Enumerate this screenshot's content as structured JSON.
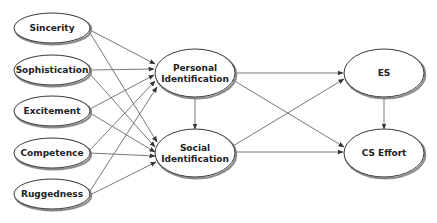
{
  "diagram": {
    "type": "path-model",
    "colors": {
      "background": "#ffffff",
      "node_stroke": "#3a3a3a",
      "node_shadow": "#8a8a8a",
      "edge": "#6a6a6a",
      "label": "#222222"
    },
    "nodes": [
      {
        "id": "sincerity",
        "label": "Sincerity",
        "lines": [
          "Sincerity"
        ],
        "cx": 52,
        "cy": 28,
        "rx": 38,
        "ry": 15
      },
      {
        "id": "sophistication",
        "label": "Sophistication",
        "lines": [
          "Sophistication"
        ],
        "cx": 52,
        "cy": 70,
        "rx": 38,
        "ry": 15
      },
      {
        "id": "excitement",
        "label": "Excitement",
        "lines": [
          "Excitement"
        ],
        "cx": 52,
        "cy": 111,
        "rx": 38,
        "ry": 15
      },
      {
        "id": "competence",
        "label": "Competence",
        "lines": [
          "Competence"
        ],
        "cx": 52,
        "cy": 153,
        "rx": 38,
        "ry": 15
      },
      {
        "id": "ruggedness",
        "label": "Ruggedness",
        "lines": [
          "Ruggedness"
        ],
        "cx": 52,
        "cy": 194,
        "rx": 38,
        "ry": 15
      },
      {
        "id": "personal_identification",
        "label": "Personal Identification",
        "lines": [
          "Personal",
          "Identification"
        ],
        "cx": 195,
        "cy": 73,
        "rx": 40,
        "ry": 24
      },
      {
        "id": "social_identification",
        "label": "Social Identification",
        "lines": [
          "Social",
          "Identification"
        ],
        "cx": 195,
        "cy": 153,
        "rx": 40,
        "ry": 24
      },
      {
        "id": "es",
        "label": "ES",
        "lines": [
          "ES"
        ],
        "cx": 384,
        "cy": 73,
        "rx": 40,
        "ry": 24
      },
      {
        "id": "cs_effort",
        "label": "CS Effort",
        "lines": [
          "CS Effort"
        ],
        "cx": 384,
        "cy": 153,
        "rx": 40,
        "ry": 24
      }
    ],
    "edges": [
      {
        "from": "sincerity",
        "to": "personal_identification",
        "x1": 90,
        "y1": 30,
        "x2": 155,
        "y2": 64
      },
      {
        "from": "sincerity",
        "to": "social_identification",
        "x1": 90,
        "y1": 33,
        "x2": 157,
        "y2": 142
      },
      {
        "from": "sophistication",
        "to": "personal_identification",
        "x1": 90,
        "y1": 70,
        "x2": 154,
        "y2": 69
      },
      {
        "from": "sophistication",
        "to": "social_identification",
        "x1": 90,
        "y1": 74,
        "x2": 155,
        "y2": 147
      },
      {
        "from": "excitement",
        "to": "personal_identification",
        "x1": 90,
        "y1": 109,
        "x2": 154,
        "y2": 75
      },
      {
        "from": "excitement",
        "to": "social_identification",
        "x1": 90,
        "y1": 113,
        "x2": 155,
        "y2": 152
      },
      {
        "from": "competence",
        "to": "personal_identification",
        "x1": 90,
        "y1": 150,
        "x2": 155,
        "y2": 81
      },
      {
        "from": "competence",
        "to": "social_identification",
        "x1": 90,
        "y1": 153,
        "x2": 155,
        "y2": 156
      },
      {
        "from": "ruggedness",
        "to": "personal_identification",
        "x1": 90,
        "y1": 191,
        "x2": 157,
        "y2": 87
      },
      {
        "from": "ruggedness",
        "to": "social_identification",
        "x1": 90,
        "y1": 195,
        "x2": 156,
        "y2": 162
      },
      {
        "from": "personal_identification",
        "to": "social_identification",
        "x1": 195,
        "y1": 97,
        "x2": 195,
        "y2": 129
      },
      {
        "from": "personal_identification",
        "to": "es",
        "x1": 235,
        "y1": 73,
        "x2": 343,
        "y2": 73
      },
      {
        "from": "personal_identification",
        "to": "cs_effort",
        "x1": 233,
        "y1": 80,
        "x2": 344,
        "y2": 147
      },
      {
        "from": "social_identification",
        "to": "es",
        "x1": 233,
        "y1": 146,
        "x2": 344,
        "y2": 79
      },
      {
        "from": "social_identification",
        "to": "cs_effort",
        "x1": 235,
        "y1": 152,
        "x2": 343,
        "y2": 152
      },
      {
        "from": "es",
        "to": "cs_effort",
        "x1": 384,
        "y1": 97,
        "x2": 384,
        "y2": 129
      }
    ]
  }
}
